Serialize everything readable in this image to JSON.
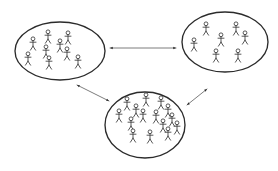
{
  "diagram": {
    "background_color": "#ffffff",
    "stroke_color": "#2b2b2b",
    "figure_color": "#3a3a3a",
    "link_color": "#6e6e6e",
    "groups": [
      {
        "id": "group-left",
        "name": "left-group",
        "label": "",
        "figure_count": 9,
        "ellipse": {
          "cx": 60,
          "cy": 51,
          "rx": 45,
          "ry": 29
        },
        "figures": [
          {
            "x": 33,
            "y": 44
          },
          {
            "x": 48,
            "y": 37
          },
          {
            "x": 68,
            "y": 38
          },
          {
            "x": 46,
            "y": 52
          },
          {
            "x": 67,
            "y": 54
          },
          {
            "x": 28,
            "y": 59
          },
          {
            "x": 49,
            "y": 63
          },
          {
            "x": 78,
            "y": 62
          },
          {
            "x": 60,
            "y": 46
          }
        ]
      },
      {
        "id": "group-top-right",
        "name": "top-right-group",
        "label": "",
        "figure_count": 7,
        "ellipse": {
          "cx": 225,
          "cy": 42,
          "rx": 43,
          "ry": 30
        },
        "figures": [
          {
            "x": 206,
            "y": 29
          },
          {
            "x": 236,
            "y": 29
          },
          {
            "x": 245,
            "y": 38
          },
          {
            "x": 221,
            "y": 40
          },
          {
            "x": 194,
            "y": 45
          },
          {
            "x": 216,
            "y": 56
          },
          {
            "x": 238,
            "y": 56
          }
        ]
      },
      {
        "id": "group-bottom",
        "name": "bottom-group",
        "label": "",
        "figure_count": 15,
        "ellipse": {
          "cx": 145,
          "cy": 125,
          "rx": 40,
          "ry": 33
        },
        "figures": [
          {
            "x": 127,
            "y": 104
          },
          {
            "x": 146,
            "y": 100
          },
          {
            "x": 161,
            "y": 103
          },
          {
            "x": 136,
            "y": 111
          },
          {
            "x": 168,
            "y": 111
          },
          {
            "x": 119,
            "y": 116
          },
          {
            "x": 143,
            "y": 116
          },
          {
            "x": 156,
            "y": 117
          },
          {
            "x": 172,
            "y": 120
          },
          {
            "x": 131,
            "y": 124
          },
          {
            "x": 163,
            "y": 126
          },
          {
            "x": 177,
            "y": 128
          },
          {
            "x": 133,
            "y": 136
          },
          {
            "x": 150,
            "y": 137
          },
          {
            "x": 168,
            "y": 134
          }
        ]
      }
    ],
    "links": [
      {
        "id": "link-left-topright",
        "name": "link-left-to-top-right",
        "label": "",
        "from": "group-left",
        "to": "group-top-right",
        "x1": 110,
        "y1": 48,
        "x2": 176,
        "y2": 48,
        "double_headed": true
      },
      {
        "id": "link-left-bottom",
        "name": "link-left-to-bottom",
        "label": "",
        "from": "group-left",
        "to": "group-bottom",
        "x1": 77,
        "y1": 85,
        "x2": 109,
        "y2": 101,
        "double_headed": true
      },
      {
        "id": "link-topright-bottom",
        "name": "link-top-right-to-bottom",
        "label": "",
        "from": "group-top-right",
        "to": "group-bottom",
        "x1": 207,
        "y1": 89,
        "x2": 187,
        "y2": 105,
        "double_headed": true
      }
    ]
  }
}
